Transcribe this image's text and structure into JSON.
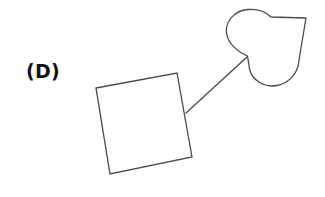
{
  "figure": {
    "background_color": "#ffffff",
    "stroke_color": "#4a4a4a",
    "label": "(D)",
    "label_color": "#111111",
    "stroke_width": 1.3,
    "shapes": {
      "square": {
        "name": "square",
        "rotation_degrees": -10,
        "corners": [
          [
            96,
            88
          ],
          [
            177,
            73
          ],
          [
            192,
            157
          ],
          [
            110,
            174
          ]
        ]
      },
      "heart": {
        "name": "heart",
        "rotation_degrees": 135,
        "cleft_point": [
          247,
          56
        ],
        "tip_point": [
          306,
          18
        ],
        "bounds": [
          226,
          8,
          82,
          80
        ]
      },
      "arrow": {
        "name": "arrow",
        "from": [
          186,
          113
        ],
        "to": [
          247,
          57
        ],
        "has_arrowhead": false
      }
    }
  }
}
